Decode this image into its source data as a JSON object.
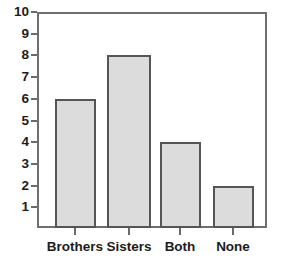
{
  "chart_data": {
    "type": "bar",
    "title": "",
    "subtitle": "",
    "xlabel": "",
    "ylabel": "",
    "categories": [
      "Brothers",
      "Sisters",
      "Both",
      "None"
    ],
    "values": [
      6,
      8,
      4,
      2
    ],
    "series": [
      {
        "name": "Count",
        "values": [
          6,
          8,
          4,
          2
        ]
      }
    ],
    "ylim": [
      0,
      10.3
    ],
    "xlim": [
      0,
      4
    ],
    "ytick_labels": [
      "1",
      "2",
      "3",
      "4",
      "5",
      "6",
      "7",
      "8",
      "9",
      "10"
    ],
    "ytick_values": [
      1,
      2,
      3,
      4,
      5,
      6,
      7,
      8,
      9,
      10
    ],
    "grid": false,
    "legend": false,
    "legend_position": "none",
    "annotations": [],
    "colors": {
      "bar_fill": "#dcdcdc",
      "bar_border": "#555555",
      "frame": "#6e6e6e",
      "tick": "#6a6a6a",
      "text": "#1c1c1c",
      "background": "#ffffff"
    }
  },
  "geometry": {
    "plot_left": 37,
    "plot_right": 267,
    "plot_top": 12,
    "plot_bottom": 228,
    "unit_px": 21.7,
    "bars": [
      {
        "left": 55,
        "width": 41
      },
      {
        "left": 107,
        "width": 44
      },
      {
        "left": 160,
        "width": 41
      },
      {
        "left": 213,
        "width": 41
      }
    ],
    "xtick_positions": [
      75,
      129,
      180,
      233
    ],
    "label_y": 240
  }
}
